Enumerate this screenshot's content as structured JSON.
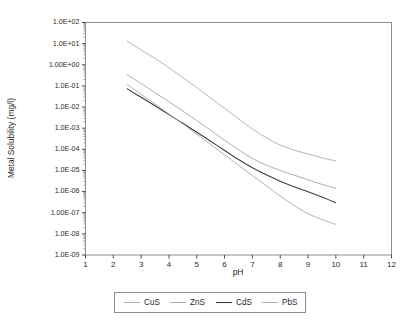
{
  "chart_data": {
    "type": "line",
    "title": "",
    "xlabel": "pH",
    "ylabel": "Metal Solubility (mg/l)",
    "xlim": [
      1,
      12
    ],
    "ylim": [
      1e-09,
      100.0
    ],
    "yscale": "log",
    "xscale": "linear",
    "grid": false,
    "legend_position": "below-plot",
    "xticks": [
      1,
      2,
      3,
      4,
      5,
      6,
      7,
      8,
      9,
      10,
      11,
      12
    ],
    "xtick_labels": [
      "1",
      "2",
      "3",
      "4",
      "5",
      "6",
      "7",
      "8",
      "9",
      "10",
      "11",
      "12"
    ],
    "yticks": [
      100,
      10,
      1,
      0.1,
      0.01,
      0.001,
      0.0001,
      1e-05,
      1e-06,
      1e-07,
      1e-08,
      1e-09
    ],
    "ytick_labels": [
      "1.0E+02",
      "1.0E+01",
      "1.00E+00",
      "1.0E-01",
      "1.0E-02",
      "1.0E-03",
      "1.0E-04",
      "1.0E-05",
      "1.0E-06",
      "1.00E-07",
      "1.0E-08",
      "1.0E-09"
    ],
    "x": [
      2.5,
      3.0,
      3.5,
      4.0,
      4.5,
      5.0,
      5.5,
      6.0,
      6.5,
      7.0,
      7.5,
      8.0,
      8.5,
      9.0,
      9.5,
      10.0
    ],
    "series": [
      {
        "name": "CuS",
        "color": "#a8a8a8",
        "width": 0.85,
        "values": [
          13.0,
          5.0,
          2.0,
          0.72,
          0.25,
          0.082,
          0.027,
          0.0087,
          0.0028,
          0.00092,
          0.00035,
          0.00016,
          9.2e-05,
          6e-05,
          4e-05,
          2.8e-05
        ]
      },
      {
        "name": "ZnS",
        "color": "#9e9e9e",
        "width": 0.85,
        "values": [
          0.33,
          0.13,
          0.048,
          0.018,
          0.0065,
          0.0023,
          0.0008,
          0.00027,
          9.5e-05,
          3.7e-05,
          1.8e-05,
          1e-05,
          6e-06,
          3.6e-06,
          2.2e-06,
          1.4e-06
        ]
      },
      {
        "name": "CdS",
        "color": "#3c3c3c",
        "width": 1.05,
        "values": [
          0.072,
          0.029,
          0.0115,
          0.0044,
          0.0017,
          0.00064,
          0.00024,
          8.8e-05,
          3.3e-05,
          1.35e-05,
          6.2e-06,
          3.1e-06,
          1.7e-06,
          9.8e-07,
          5.5e-07,
          3e-07
        ]
      },
      {
        "name": "PbS",
        "color": "#a3a3a3",
        "width": 0.85,
        "values": [
          0.115,
          0.04,
          0.014,
          0.0047,
          0.0016,
          0.00052,
          0.00017,
          5.5e-05,
          1.75e-05,
          5.7e-06,
          1.9e-06,
          6.2e-07,
          2.2e-07,
          9e-08,
          4.8e-08,
          2.8e-08
        ]
      }
    ],
    "legend_entries": [
      {
        "label": "CuS",
        "color": "#a8a8a8"
      },
      {
        "label": "ZnS",
        "color": "#9e9e9e"
      },
      {
        "label": "CdS",
        "color": "#3c3c3c"
      },
      {
        "label": "PbS",
        "color": "#a3a3a3"
      }
    ]
  },
  "figure": {
    "background": "#ffffff",
    "frame_color": "#8d8d8d"
  }
}
